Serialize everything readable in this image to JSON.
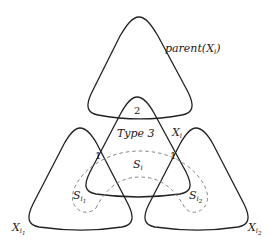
{
  "diagram": {
    "shapes": {
      "parent": {
        "label_main": "parent(X",
        "label_sub": "i",
        "label_close": ")"
      },
      "xi": {
        "label_main": "X",
        "label_sub": "i"
      },
      "xi1": {
        "label_main": "X",
        "label_sub": "i",
        "label_subsub": "1"
      },
      "xi2": {
        "label_main": "X",
        "label_sub": "i",
        "label_subsub": "2"
      }
    },
    "separators": {
      "si": {
        "label_main": "S",
        "label_sub": "i"
      },
      "si1": {
        "label_main": "S",
        "label_sub": "i",
        "label_subsub": "1"
      },
      "si2": {
        "label_main": "S",
        "label_sub": "i",
        "label_subsub": "2"
      }
    },
    "region_labels": {
      "type": "Type 3",
      "overlap_parent": "2",
      "overlap_left": "1",
      "overlap_right": "1"
    },
    "colors": {
      "stroke": "#222222",
      "dashed": "#888888",
      "background": "#ffffff"
    }
  }
}
